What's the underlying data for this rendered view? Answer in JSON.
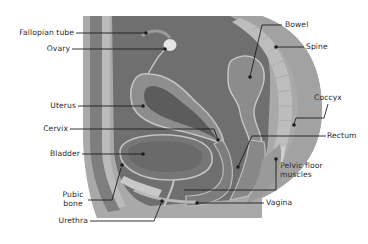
{
  "diagram": {
    "colors": {
      "background": "#ffffff",
      "outer_body": "#a9a9a9",
      "body_band_dark": "#7d7d7d",
      "body_band_light": "#b8b8b8",
      "cavity": "#6f6f6f",
      "organ_fill": "#8e8e8e",
      "organ_inner": "#5c5c5c",
      "organ_outline": "#c4c4c4",
      "spine": "#bdbdbd",
      "leader_line": "#1e1e1e",
      "label_text": "#2a2a2a"
    },
    "labels": {
      "fallopian_tube": "Fallopian tube",
      "ovary": "Ovary",
      "uterus": "Uterus",
      "cervix": "Cervix",
      "bladder": "Bladder",
      "pubic_bone_line1": "Pubic",
      "pubic_bone_line2": "bone",
      "urethra": "Urethra",
      "bowel": "Bowel",
      "spine": "Spine",
      "coccyx": "Coccyx",
      "rectum": "Rectum",
      "pelvic_floor_line1": "Pelvic floor",
      "pelvic_floor_line2": "muscles",
      "vagina": "Vagina"
    }
  }
}
